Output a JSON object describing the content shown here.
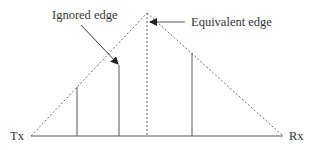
{
  "diagram": {
    "labels": {
      "ignored_edge": "Ignored edge",
      "equivalent_edge": "Equivalent edge",
      "tx": "Tx",
      "rx": "Rx"
    },
    "colors": {
      "line": "#555555",
      "dashed": "#666666",
      "text": "#333333",
      "background": "#ffffff"
    }
  }
}
